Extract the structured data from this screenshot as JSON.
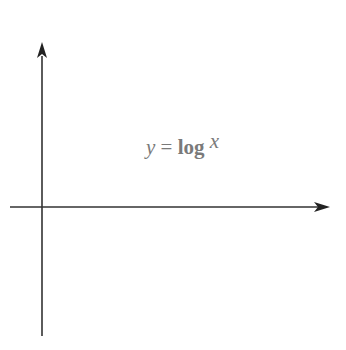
{
  "chart_data": {
    "type": "line",
    "title": "",
    "equation_label": {
      "prefix": "y = log",
      "subscript": "10",
      "suffix": " x"
    },
    "xlabel": "x",
    "ylabel": "y",
    "xlim": [
      -1,
      11
    ],
    "ylim": [
      -5,
      6
    ],
    "grid": true,
    "x_tick_labels": [
      {
        "value": 0,
        "label": "0"
      },
      {
        "value": 5,
        "label": "5"
      },
      {
        "value": 10,
        "label": "10"
      }
    ],
    "y_tick_labels": [
      {
        "value": 1,
        "label": "1"
      },
      {
        "value": -1,
        "label": "−1"
      }
    ],
    "series": [
      {
        "name": "y = log10 x",
        "color": "#7d7d7d",
        "x": [
          0.01,
          0.05,
          0.1,
          0.2,
          0.5,
          1,
          2,
          3,
          4,
          5,
          6,
          7,
          8,
          9,
          10,
          11.5
        ],
        "y": [
          -2,
          -1.3,
          -1,
          -0.7,
          -0.3,
          0,
          0.301,
          0.477,
          0.602,
          0.699,
          0.778,
          0.845,
          0.903,
          0.954,
          1,
          1.06
        ]
      }
    ]
  },
  "labels": {
    "x_axis": "x",
    "y_axis": "y",
    "origin": "0",
    "tick_5": "5",
    "tick_10": "10",
    "tick_1": "1",
    "tick_neg1": "−1",
    "eq_prefix": "y = log",
    "eq_sub": "10",
    "eq_suffix": " x"
  }
}
